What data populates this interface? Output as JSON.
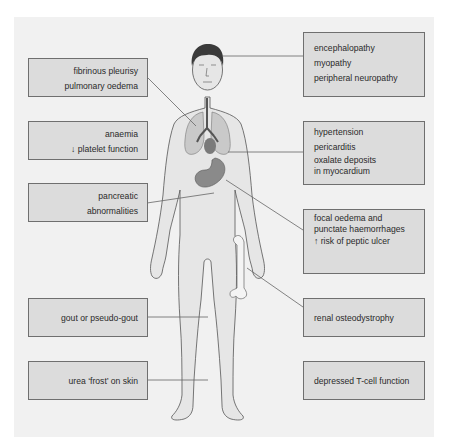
{
  "diagram": {
    "left_labels": [
      {
        "lines": [
          "fibrinous pleurisy",
          "pulmonary oedema"
        ],
        "target": "lungs"
      },
      {
        "lines": [
          "anaemia",
          "↓ platelet function"
        ],
        "target": "blood"
      },
      {
        "lines": [
          "pancreatic",
          "abnormalities"
        ],
        "target": "pancreas"
      },
      {
        "lines": [
          "gout or pseudo-gout"
        ],
        "target": "knee joint"
      },
      {
        "lines": [
          "urea ‘frost’ on skin"
        ],
        "target": "skin"
      }
    ],
    "right_labels": [
      {
        "lines": [
          "encephalopathy",
          "myopathy",
          "peripheral neuropathy"
        ],
        "target": "head"
      },
      {
        "lines": [
          "hypertension",
          "pericarditis",
          "oxalate deposits",
          "in myocardium"
        ],
        "target": "heart"
      },
      {
        "lines": [
          "focal oedema and",
          "punctate haemorrhages",
          "↑ risk of peptic ulcer"
        ],
        "target": "stomach"
      },
      {
        "lines": [
          "renal osteodystrophy"
        ],
        "target": "femur bone"
      },
      {
        "lines": [
          "depressed T-cell function"
        ],
        "target": "immune system"
      }
    ],
    "colors": {
      "background": "#f1f1f1",
      "box_fill": "#dcdcdc",
      "box_border": "#6f6f6f",
      "skin": "#e6e6e6",
      "organ_lung": "#c9c9c9",
      "organ_stomach": "#8a8a8a",
      "hair": "#3a3a3a"
    }
  }
}
